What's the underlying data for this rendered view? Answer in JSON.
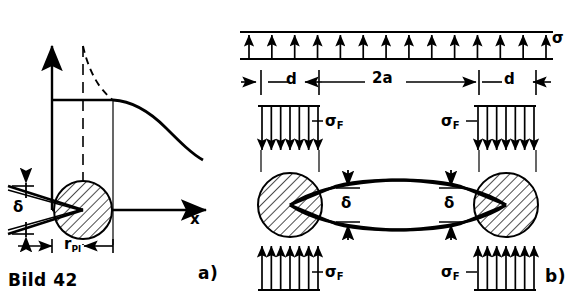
{
  "figure": {
    "caption": "Bild 42",
    "panels": [
      {
        "id": "a",
        "label": "a)"
      },
      {
        "id": "b",
        "label": "b)"
      }
    ]
  },
  "panel_a": {
    "axis_x_label": "x",
    "crack_opening_label": "δ",
    "plastic_radius_label": "r",
    "plastic_radius_sub": "Pl",
    "curve_description": "stress-distribution"
  },
  "panel_b": {
    "applied_stress_label": "σ",
    "yield_stress_label": "σ",
    "yield_stress_sub": "F",
    "dim_left": "d",
    "dim_center": "2a",
    "dim_right": "d",
    "opening_left": "δ",
    "opening_right": "δ",
    "top_arrow_count": 14,
    "block_arrow_count": 7
  },
  "chart_data": {
    "type": "line",
    "title": "Bild 42",
    "xlabel": "x",
    "ylabel": "",
    "series": [
      {
        "name": "stress-plateau",
        "x": [
          0.16,
          0.6
        ],
        "y": [
          0.5,
          0.5
        ]
      },
      {
        "name": "stress-decay",
        "x": [
          0.6,
          0.7,
          0.8,
          0.9,
          1.0
        ],
        "y": [
          0.5,
          0.4,
          0.33,
          0.28,
          0.25
        ]
      },
      {
        "name": "elastic-singularity-dashed",
        "x": [
          0.4,
          0.45,
          0.52,
          0.6
        ],
        "y": [
          1.0,
          0.86,
          0.66,
          0.5
        ]
      }
    ],
    "annotations": [
      "δ",
      "r_Pl",
      "x",
      "a)",
      "b)",
      "σ",
      "σ_F",
      "d",
      "2a",
      "d"
    ]
  },
  "colors": {
    "ink": "#000000",
    "background": "#ffffff"
  }
}
